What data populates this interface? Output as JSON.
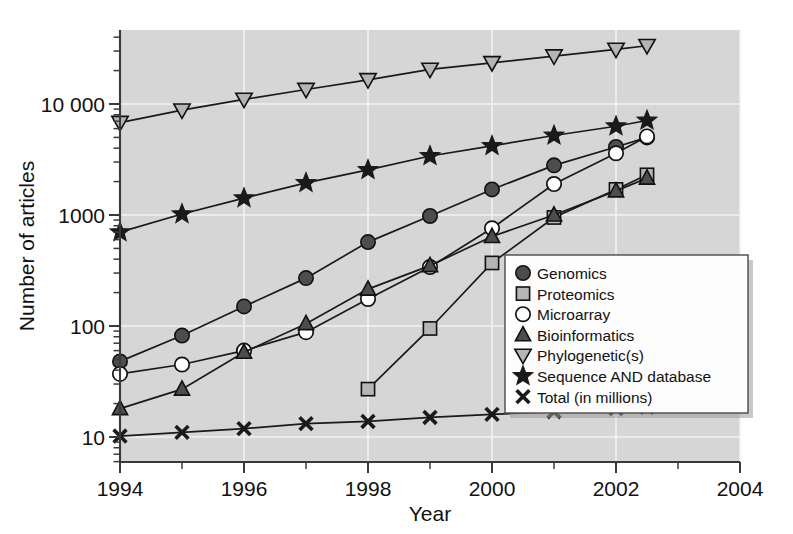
{
  "chart_data": {
    "type": "line",
    "title": "",
    "xlabel": "Year",
    "ylabel": "Number of articles",
    "yscale": "log",
    "ylim": [
      7,
      50000
    ],
    "xlim": [
      1994,
      2004
    ],
    "grid": true,
    "legend_position": "inside-right",
    "x_tick_labels": [
      "1994",
      "1996",
      "1998",
      "2000",
      "2002",
      "2004"
    ],
    "x_tick_values": [
      1994,
      1996,
      1998,
      2000,
      2002,
      2004
    ],
    "x_minor_ticks": [
      1995,
      1997,
      1999,
      2001,
      2003
    ],
    "y_tick_labels": [
      "10",
      "100",
      "1000",
      "10 000"
    ],
    "y_tick_values": [
      10,
      100,
      1000,
      10000
    ],
    "series": [
      {
        "name": "Genomics",
        "marker": "filled-circle",
        "x": [
          1994,
          1995,
          1996,
          1997,
          1998,
          1999,
          2000,
          2001,
          2002,
          2002.5
        ],
        "values": [
          48,
          82,
          150,
          270,
          570,
          980,
          1700,
          2800,
          4100,
          5000
        ]
      },
      {
        "name": "Proteomics",
        "marker": "filled-square",
        "x": [
          1998,
          1999,
          2000,
          2001,
          2002,
          2002.5
        ],
        "values": [
          27,
          95,
          370,
          950,
          1700,
          2300
        ]
      },
      {
        "name": "Microarray",
        "marker": "open-circle",
        "x": [
          1994,
          1995,
          1996,
          1997,
          1998,
          1999,
          2000,
          2001,
          2002,
          2002.5
        ],
        "values": [
          37,
          45,
          60,
          88,
          175,
          340,
          760,
          1900,
          3600,
          5100
        ]
      },
      {
        "name": "Bioinformatics",
        "marker": "filled-triangle-up",
        "x": [
          1994,
          1995,
          1996,
          1997,
          1998,
          1999,
          2000,
          2001,
          2002,
          2002.5
        ],
        "values": [
          18,
          27,
          58,
          105,
          215,
          350,
          640,
          1000,
          1650,
          2150
        ]
      },
      {
        "name": "Phylogenetic(s)",
        "marker": "open-triangle-down",
        "x": [
          1994,
          1995,
          1996,
          1997,
          1998,
          1999,
          2000,
          2001,
          2002,
          2002.5
        ],
        "values": [
          6800,
          8800,
          11000,
          13500,
          16500,
          20500,
          23500,
          27000,
          31000,
          33500
        ]
      },
      {
        "name": "Sequence AND database",
        "marker": "filled-star",
        "x": [
          1994,
          1995,
          1996,
          1997,
          1998,
          1999,
          2000,
          2001,
          2002,
          2002.5
        ],
        "values": [
          700,
          1020,
          1420,
          1950,
          2550,
          3400,
          4200,
          5200,
          6300,
          7100
        ]
      },
      {
        "name": "Total (in millions)",
        "marker": "cross",
        "x": [
          1994,
          1995,
          1996,
          1997,
          1998,
          1999,
          2000,
          2001,
          2002,
          2002.5
        ],
        "values": [
          10.2,
          11.0,
          11.9,
          13.2,
          13.8,
          15.0,
          16.0,
          16.9,
          18.0,
          18.5
        ]
      }
    ]
  },
  "legend": {
    "entries": [
      {
        "label": "Genomics",
        "marker": "filled-circle"
      },
      {
        "label": "Proteomics",
        "marker": "filled-square"
      },
      {
        "label": "Microarray",
        "marker": "open-circle"
      },
      {
        "label": "Bioinformatics",
        "marker": "filled-triangle-up"
      },
      {
        "label": "Phylogenetic(s)",
        "marker": "open-triangle-down"
      },
      {
        "label": "Sequence AND database",
        "marker": "filled-star"
      },
      {
        "label": "Total (in millions)",
        "marker": "cross"
      }
    ]
  },
  "axes": {
    "x_title": "Year",
    "y_title": "Number of articles"
  }
}
